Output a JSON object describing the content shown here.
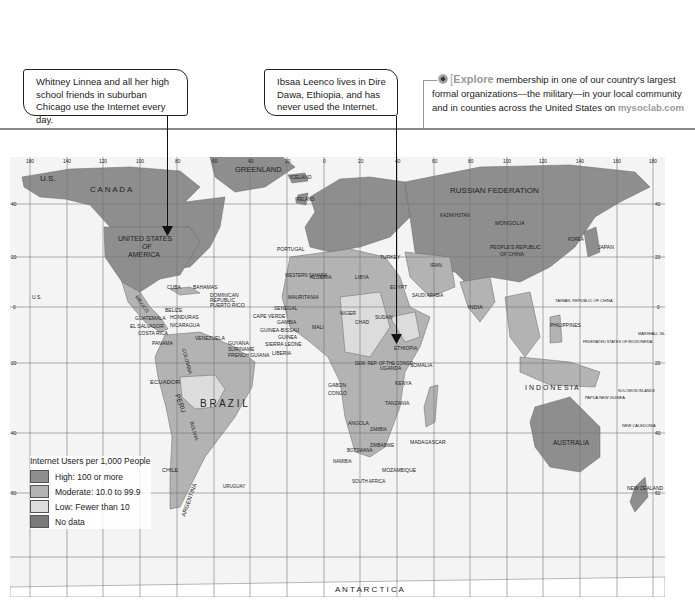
{
  "callouts": [
    {
      "text": "Whitney Linnea and all her high school friends in suburban Chicago use the Internet every day."
    },
    {
      "text": "Ibsaa Leenco lives in Dire Dawa, Ethiopia, and has never used the Internet."
    }
  ],
  "explore": {
    "icon": "explore-target-icon",
    "keyword": "Explore",
    "text": " membership in one of our country's largest formal organizations—the military—in your local community and in counties across the United States on ",
    "link": "mysoclab.com"
  },
  "map": {
    "longitude_ticks": [
      "180",
      "140",
      "120",
      "100",
      "80",
      "60",
      "40",
      "20",
      "0",
      "20",
      "40",
      "60",
      "80",
      "100",
      "120",
      "140",
      "160",
      "180"
    ],
    "latitude_ticks": [
      "60",
      "40",
      "20",
      "0",
      "20",
      "40",
      "60"
    ],
    "colors": {
      "high": "#8e8e8e",
      "moderate": "#b3b3b3",
      "low": "#dcdcdc",
      "no_data": "#7a7a7a",
      "ocean": "#f4f4f4",
      "grid": "#777777"
    },
    "labels": {
      "us_alaska": "U.S.",
      "canada": "C A N A D A",
      "greenland": "GREENLAND",
      "iceland": "ICELAND",
      "usa": "UNITED STATES",
      "usa2": "OF",
      "usa3": "AMERICA",
      "mexico": "MEXICO",
      "cuba": "CUBA",
      "bahamas": "BAHAMAS",
      "dominican": "DOMINICAN",
      "republic": "REPUBLIC",
      "puerto_rico": "PUERTO RICO",
      "belize": "BELIZE",
      "honduras": "HONDURAS",
      "guatemala": "GUATEMALA",
      "el_salvador": "EL SALVADOR",
      "nicaragua": "NICARAGUA",
      "costa_rica": "COSTA RICA",
      "panama": "PANAMA",
      "venezuela": "VENEZUELA",
      "guyana": "GUYANA",
      "suriname": "SURINAME",
      "french_guiana": "FRENCH GUIANA",
      "colombia": "COLOMBIA",
      "ecuador": "ECUADOR",
      "peru": "PERU",
      "brazil": "B R A Z I L",
      "bolivia": "BOLIVIA",
      "chile": "CHILE",
      "argentina": "ARGENTINA",
      "uruguay": "URUGUAY",
      "hawaii_us": "U.S.",
      "portugal": "PORTUGAL",
      "ireland": "IRELAND",
      "western_sahara": "WESTERN SAHARA",
      "mauritania": "MAURITANIA",
      "senegal": "SENEGAL",
      "cape_verde": "CAPE VERDE",
      "gambia": "GAMBIA",
      "guinea_bissau": "GUINEA-BISSAU",
      "guinea": "GUINEA",
      "sierra_leone": "SIERRA LEONE",
      "liberia": "LIBERIA",
      "algeria": "ALGERIA",
      "libya": "LIBYA",
      "egypt": "EGYPT",
      "mali": "MALI",
      "niger": "NIGER",
      "chad": "CHAD",
      "sudan": "SUDAN",
      "ethiopia": "ETHIOPIA",
      "somalia": "SOMALIA",
      "kenya": "KENYA",
      "uganda": "UGANDA",
      "drc": "DEM. REP. OF THE CONGO",
      "gabon": "GABON",
      "congo": "CONGO",
      "tanzania": "TANZANIA",
      "angola": "ANGOLA",
      "zambia": "ZAMBIA",
      "namibia": "NAMIBIA",
      "botswana": "BOTSWANA",
      "zimbabwe": "ZIMBABWE",
      "mozambique": "MOZAMBIQUE",
      "south_africa": "SOUTH AFRICA",
      "madagascar": "MADAGASCAR",
      "saudi_arabia": "SAUDI ARABIA",
      "iran": "IRAN",
      "turkey": "TURKEY",
      "russia": "RUSSIAN   FEDERATION",
      "kazakhstan": "KAZAKHSTAN",
      "mongolia": "MONGOLIA",
      "china": "PEOPLE'S REPUBLIC",
      "china2": "OF CHINA",
      "japan": "JAPAN",
      "korea": "KOREA",
      "india": "INDIA",
      "taiwan": "TAIWAN, REPUBLIC OF CHINA",
      "philippines": "PHILIPPINES",
      "micronesia": "FEDERATED STATES OF MICRONESIA",
      "marshall": "MARSHALL ISLANDS",
      "indonesia": "I N D O N E S I A",
      "png": "PAPUA NEW GUINEA",
      "solomon": "SOLOMON ISLANDS",
      "australia": "AUSTRALIA",
      "new_zealand": "NEW ZEALAND",
      "new_caledonia": "NEW CALEDONIA",
      "antarctica": "A N T A R C T I C A"
    }
  },
  "legend": {
    "title": "Internet Users per 1,000 People",
    "items": [
      {
        "label": "High: 100 or more",
        "color": "#8e8e8e"
      },
      {
        "label": "Moderate: 10.0 to 99.9",
        "color": "#b3b3b3"
      },
      {
        "label": "Low: Fewer than 10",
        "color": "#dcdcdc"
      },
      {
        "label": "No data",
        "color": "#7a7a7a"
      }
    ]
  }
}
